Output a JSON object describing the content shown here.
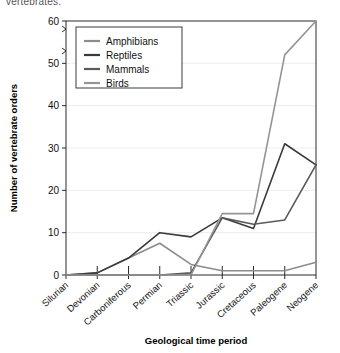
{
  "caption_fragment": "vertebrates.",
  "chart_data": {
    "type": "line",
    "title": "",
    "xlabel": "Geological time period",
    "ylabel": "Number of vertebrate orders",
    "ylim": [
      0,
      60
    ],
    "yticks": [
      0,
      10,
      20,
      30,
      40,
      50,
      60
    ],
    "grid": true,
    "legend_position": "top-left",
    "categories": [
      "Silurian",
      "Devonian",
      "Carboniferous",
      "Permian",
      "Triassic",
      "Jurassic",
      "Cretaceous",
      "Paleogene",
      "Neogene"
    ],
    "x": [
      0,
      1,
      2,
      3,
      4,
      5,
      6,
      7,
      8
    ],
    "series": [
      {
        "name": "Amphibians",
        "color": "#8c8c8c",
        "values": [
          0,
          0.5,
          4,
          7.5,
          2.5,
          1,
          1,
          1,
          3
        ]
      },
      {
        "name": "Reptiles",
        "color": "#3a3a3a",
        "values": [
          0,
          0.5,
          4,
          10,
          9,
          13.5,
          11,
          31,
          26
        ]
      },
      {
        "name": "Mammals",
        "color": "#5a5a5a",
        "values": [
          0,
          0,
          0,
          0,
          0.5,
          13.5,
          12,
          13,
          26
        ]
      },
      {
        "name": "Birds",
        "color": "#949494",
        "values": [
          0,
          0,
          0,
          0,
          0,
          14.5,
          14.5,
          52,
          60
        ]
      }
    ]
  },
  "legend": {
    "items": [
      {
        "label": "Amphibians"
      },
      {
        "label": "Reptiles"
      },
      {
        "label": "Mammals"
      },
      {
        "label": "Birds"
      }
    ]
  }
}
